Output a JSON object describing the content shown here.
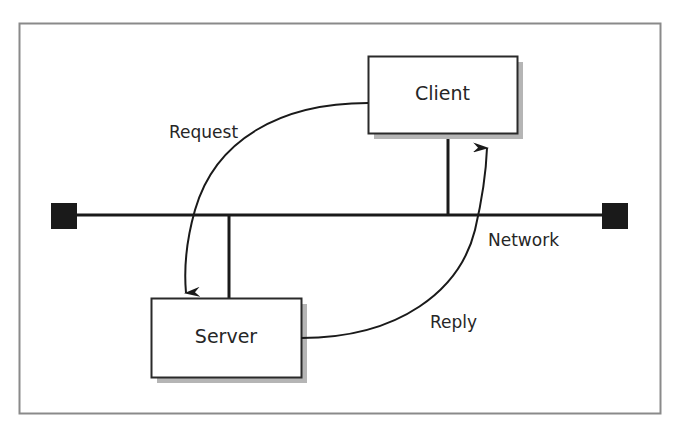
{
  "diagram": {
    "type": "client-server network",
    "frame": {
      "x": 19,
      "y": 23,
      "width": 642,
      "height": 391,
      "border_color": "#8a8a8a"
    },
    "network": {
      "label": "Network",
      "line": {
        "x1": 64,
        "x2": 615,
        "y": 215
      },
      "terminators": [
        {
          "name": "left-terminator",
          "x": 51,
          "y": 203,
          "size": 26
        },
        {
          "name": "right-terminator",
          "x": 602,
          "y": 203,
          "size": 26
        }
      ],
      "color": "#1a1a1a"
    },
    "nodes": {
      "client": {
        "label": "Client",
        "x": 368,
        "y": 56,
        "width": 149,
        "height": 77,
        "stub_x": 448
      },
      "server": {
        "label": "Server",
        "x": 151,
        "y": 298,
        "width": 150,
        "height": 79,
        "stub_x": 229
      }
    },
    "arrows": {
      "request": {
        "label": "Request",
        "from": "Client",
        "to": "Server"
      },
      "reply": {
        "label": "Reply",
        "from": "Server",
        "to": "Client"
      }
    },
    "shadow_color": "#b5b5b5"
  }
}
